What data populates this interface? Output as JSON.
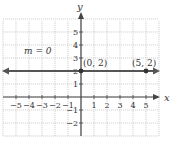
{
  "chart_data": {
    "type": "line",
    "title": "",
    "xlabel": "x",
    "ylabel": "y",
    "xlim": [
      -6,
      6
    ],
    "ylim": [
      -3,
      6
    ],
    "grid": true,
    "x_ticks": [
      -5,
      -4,
      -3,
      -2,
      -1,
      1,
      2,
      3,
      4,
      5
    ],
    "y_ticks": [
      -2,
      -1,
      1,
      2,
      3,
      4,
      5
    ],
    "x_tick_labels": [
      "−5",
      "−4",
      "−3",
      "−2",
      "−1",
      "1",
      "2",
      "3",
      "4",
      "5"
    ],
    "y_tick_labels": [
      "−2",
      "−1",
      "1",
      "2",
      "3",
      "4",
      "5"
    ],
    "series": [
      {
        "name": "y = 2",
        "equation": "y = 2",
        "x": [
          -6,
          6
        ],
        "y": [
          2,
          2
        ],
        "arrows": "both"
      }
    ],
    "points": [
      {
        "x": 0,
        "y": 2,
        "label": "(0, 2)"
      },
      {
        "x": 5,
        "y": 2,
        "label": "(5, 2)"
      }
    ],
    "annotations": [
      {
        "text": "m = 0",
        "x": -4,
        "y": 3.5
      }
    ]
  },
  "labels": {
    "x_axis": "x",
    "y_axis": "y",
    "slope": "m = 0",
    "point_a": "(0, 2)",
    "point_b": "(5, 2)"
  },
  "colors": {
    "grid": "#c8c8c8",
    "axis": "#444444",
    "line": "#555555",
    "point": "#333333"
  }
}
